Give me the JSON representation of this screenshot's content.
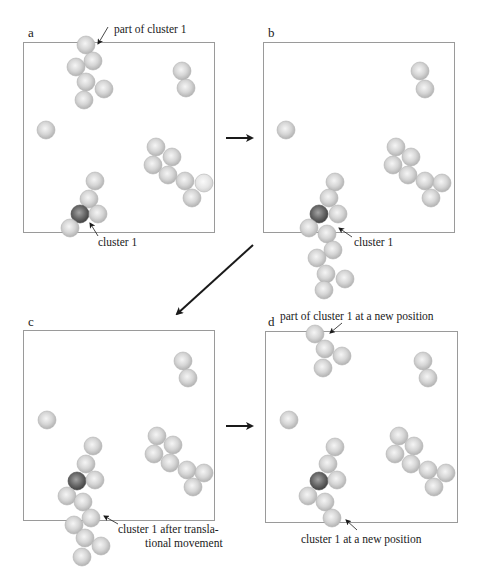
{
  "figure": {
    "width": 478,
    "height": 581,
    "sphere_radius": 9,
    "colors": {
      "sphere_light": "#c9c9c9",
      "sphere_highlight": "#f4f4f4",
      "sphere_edge": "#a8a8a8",
      "sphere_dark": "#5a5a5a",
      "sphere_dark_highlight": "#9c9c9c",
      "box_border": "#9a9a9a",
      "arrow": "#1a1a1a",
      "text": "#1a1a1a"
    }
  },
  "panels": [
    {
      "id": "a",
      "letter": "a",
      "letter_pos": [
        28,
        37
      ],
      "box": [
        23,
        42,
        191,
        190
      ],
      "spheres": [
        {
          "x": 86,
          "y": 45,
          "group": "part-of-cluster-1"
        },
        {
          "x": 93,
          "y": 61,
          "group": "part-of-cluster-1"
        },
        {
          "x": 76,
          "y": 67,
          "group": "part-of-cluster-1"
        },
        {
          "x": 86,
          "y": 82,
          "group": "part-of-cluster-1"
        },
        {
          "x": 104,
          "y": 89,
          "group": "part-of-cluster-1"
        },
        {
          "x": 84,
          "y": 100,
          "group": "part-of-cluster-1"
        },
        {
          "x": 182,
          "y": 71,
          "group": "pair"
        },
        {
          "x": 186,
          "y": 88,
          "group": "pair"
        },
        {
          "x": 46,
          "y": 130,
          "group": "single"
        },
        {
          "x": 156,
          "y": 147,
          "group": "cluster-right"
        },
        {
          "x": 172,
          "y": 157,
          "group": "cluster-right"
        },
        {
          "x": 153,
          "y": 165,
          "group": "cluster-right"
        },
        {
          "x": 168,
          "y": 175,
          "group": "cluster-right"
        },
        {
          "x": 185,
          "y": 181,
          "group": "cluster-right"
        },
        {
          "x": 204,
          "y": 183,
          "group": "cluster-right",
          "faded": true
        },
        {
          "x": 192,
          "y": 198,
          "group": "cluster-right"
        },
        {
          "x": 95,
          "y": 181,
          "group": "cluster-1"
        },
        {
          "x": 89,
          "y": 199,
          "group": "cluster-1"
        },
        {
          "x": 80,
          "y": 214,
          "group": "cluster-1",
          "dark": true
        },
        {
          "x": 98,
          "y": 214,
          "group": "cluster-1"
        },
        {
          "x": 70,
          "y": 228,
          "group": "cluster-1"
        }
      ],
      "annotations": [
        {
          "text": "part of cluster 1",
          "x": 114,
          "y": 33,
          "arrow_from": [
            108,
            27
          ],
          "arrow_to": [
            98,
            44
          ]
        },
        {
          "text": "cluster 1",
          "x": 98,
          "y": 246,
          "arrow_from": [
            98,
            236
          ],
          "arrow_to": [
            90,
            223
          ]
        }
      ]
    },
    {
      "id": "b",
      "letter": "b",
      "letter_pos": [
        268,
        37
      ],
      "box": [
        263,
        42,
        191,
        190
      ],
      "spheres": [
        {
          "x": 420,
          "y": 71,
          "group": "pair"
        },
        {
          "x": 425,
          "y": 89,
          "group": "pair"
        },
        {
          "x": 286,
          "y": 130,
          "group": "single"
        },
        {
          "x": 396,
          "y": 147,
          "group": "cluster-right"
        },
        {
          "x": 411,
          "y": 157,
          "group": "cluster-right"
        },
        {
          "x": 393,
          "y": 165,
          "group": "cluster-right"
        },
        {
          "x": 408,
          "y": 175,
          "group": "cluster-right"
        },
        {
          "x": 425,
          "y": 181,
          "group": "cluster-right"
        },
        {
          "x": 442,
          "y": 183,
          "group": "cluster-right"
        },
        {
          "x": 431,
          "y": 198,
          "group": "cluster-right"
        },
        {
          "x": 335,
          "y": 182,
          "group": "cluster-1"
        },
        {
          "x": 329,
          "y": 198,
          "group": "cluster-1"
        },
        {
          "x": 319,
          "y": 214,
          "group": "cluster-1",
          "dark": true
        },
        {
          "x": 338,
          "y": 214,
          "group": "cluster-1"
        },
        {
          "x": 309,
          "y": 228,
          "group": "cluster-1"
        },
        {
          "x": 327,
          "y": 234,
          "group": "cluster-1"
        },
        {
          "x": 333,
          "y": 250,
          "group": "cluster-1"
        },
        {
          "x": 317,
          "y": 258,
          "group": "cluster-1"
        },
        {
          "x": 326,
          "y": 274,
          "group": "cluster-1"
        },
        {
          "x": 345,
          "y": 279,
          "group": "cluster-1"
        },
        {
          "x": 324,
          "y": 290,
          "group": "cluster-1"
        }
      ],
      "annotations": [
        {
          "text": "cluster 1",
          "x": 354,
          "y": 246,
          "arrow_from": [
            352,
            237
          ],
          "arrow_to": [
            339,
            228
          ]
        }
      ]
    },
    {
      "id": "c",
      "letter": "c",
      "letter_pos": [
        28,
        326
      ],
      "box": [
        23,
        330,
        191,
        190
      ],
      "spheres": [
        {
          "x": 183,
          "y": 361,
          "group": "pair"
        },
        {
          "x": 188,
          "y": 378,
          "group": "pair"
        },
        {
          "x": 47,
          "y": 420,
          "group": "single"
        },
        {
          "x": 157,
          "y": 436,
          "group": "cluster-right"
        },
        {
          "x": 173,
          "y": 445,
          "group": "cluster-right"
        },
        {
          "x": 154,
          "y": 454,
          "group": "cluster-right"
        },
        {
          "x": 170,
          "y": 463,
          "group": "cluster-right"
        },
        {
          "x": 187,
          "y": 470,
          "group": "cluster-right"
        },
        {
          "x": 204,
          "y": 473,
          "group": "cluster-right"
        },
        {
          "x": 193,
          "y": 487,
          "group": "cluster-right"
        },
        {
          "x": 93,
          "y": 446,
          "group": "cluster-1"
        },
        {
          "x": 86,
          "y": 464,
          "group": "cluster-1"
        },
        {
          "x": 77,
          "y": 481,
          "group": "cluster-1",
          "dark": true
        },
        {
          "x": 95,
          "y": 480,
          "group": "cluster-1"
        },
        {
          "x": 67,
          "y": 496,
          "group": "cluster-1"
        },
        {
          "x": 83,
          "y": 502,
          "group": "cluster-1"
        },
        {
          "x": 91,
          "y": 518,
          "group": "cluster-1"
        },
        {
          "x": 74,
          "y": 525,
          "group": "cluster-1"
        },
        {
          "x": 85,
          "y": 538,
          "group": "cluster-1"
        },
        {
          "x": 101,
          "y": 546,
          "group": "cluster-1"
        },
        {
          "x": 82,
          "y": 557,
          "group": "cluster-1"
        }
      ],
      "annotations": [
        {
          "text": "cluster 1 after transla-",
          "text2": "tional movement",
          "x": 118,
          "y": 533,
          "x2": 145,
          "y2": 547,
          "arrow_from": [
            118,
            524
          ],
          "arrow_to": [
            104,
            516
          ]
        }
      ]
    },
    {
      "id": "d",
      "letter": "d",
      "letter_pos": [
        268,
        326
      ],
      "box": [
        265,
        331,
        192,
        191
      ],
      "spheres": [
        {
          "x": 315,
          "y": 334,
          "group": "part-of-cluster-1"
        },
        {
          "x": 325,
          "y": 349,
          "group": "part-of-cluster-1"
        },
        {
          "x": 342,
          "y": 356,
          "group": "part-of-cluster-1"
        },
        {
          "x": 323,
          "y": 368,
          "group": "part-of-cluster-1"
        },
        {
          "x": 423,
          "y": 361,
          "group": "pair"
        },
        {
          "x": 428,
          "y": 378,
          "group": "pair"
        },
        {
          "x": 289,
          "y": 420,
          "group": "single"
        },
        {
          "x": 399,
          "y": 436,
          "group": "cluster-right"
        },
        {
          "x": 414,
          "y": 446,
          "group": "cluster-right"
        },
        {
          "x": 395,
          "y": 454,
          "group": "cluster-right"
        },
        {
          "x": 411,
          "y": 464,
          "group": "cluster-right"
        },
        {
          "x": 428,
          "y": 470,
          "group": "cluster-right"
        },
        {
          "x": 446,
          "y": 473,
          "group": "cluster-right"
        },
        {
          "x": 434,
          "y": 487,
          "group": "cluster-right"
        },
        {
          "x": 335,
          "y": 447,
          "group": "cluster-1"
        },
        {
          "x": 328,
          "y": 464,
          "group": "cluster-1"
        },
        {
          "x": 319,
          "y": 481,
          "group": "cluster-1",
          "dark": true
        },
        {
          "x": 337,
          "y": 480,
          "group": "cluster-1"
        },
        {
          "x": 308,
          "y": 496,
          "group": "cluster-1"
        },
        {
          "x": 325,
          "y": 502,
          "group": "cluster-1"
        },
        {
          "x": 332,
          "y": 518,
          "group": "cluster-1"
        }
      ],
      "annotations": [
        {
          "text": "part of cluster 1 at a new position",
          "x": 280,
          "y": 320,
          "arrow_from": [
            342,
            323
          ],
          "arrow_to": [
            330,
            333
          ]
        },
        {
          "text": "cluster 1 at a new position",
          "x": 301,
          "y": 543,
          "arrow_from": [
            357,
            530
          ],
          "arrow_to": [
            346,
            520
          ]
        }
      ]
    }
  ],
  "arrows": [
    {
      "id": "a-to-b",
      "from": [
        226,
        138
      ],
      "to": [
        252,
        138
      ]
    },
    {
      "id": "b-to-c",
      "from": [
        253,
        245
      ],
      "to": [
        177,
        314
      ]
    },
    {
      "id": "c-to-d",
      "from": [
        226,
        426
      ],
      "to": [
        252,
        426
      ]
    }
  ]
}
